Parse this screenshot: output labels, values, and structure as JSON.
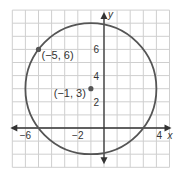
{
  "chart_data": {
    "type": "scatter",
    "title": "",
    "xlabel": "x",
    "ylabel": "y",
    "xlim": [
      -7,
      5
    ],
    "ylim": [
      -3,
      9
    ],
    "grid": true,
    "x_tick_labels": [
      {
        "value": -6,
        "label": "−6"
      },
      {
        "value": -2,
        "label": "−2"
      },
      {
        "value": 4,
        "label": "4"
      }
    ],
    "y_tick_labels": [
      {
        "value": 2,
        "label": "2"
      },
      {
        "value": 4,
        "label": "4"
      },
      {
        "value": 6,
        "label": "6"
      }
    ],
    "circle": {
      "center": [
        -1,
        3
      ],
      "radius": 5
    },
    "points": [
      {
        "x": -5,
        "y": 6,
        "label": "(−5, 6)"
      },
      {
        "x": -1,
        "y": 3,
        "label": "(−1, 3)"
      }
    ]
  }
}
